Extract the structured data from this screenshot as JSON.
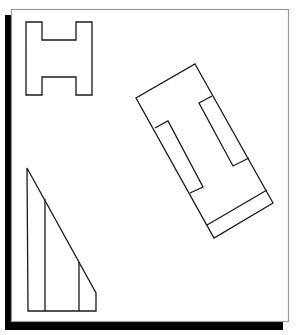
{
  "figure": {
    "panel": {
      "x": 11,
      "y": 9,
      "width": 278,
      "height": 313,
      "border_color": "#999999",
      "fill": "#ffffff"
    },
    "shadow": {
      "color": "#000000"
    },
    "stroke_color": "#1a1a1a",
    "shapes": [
      {
        "name": "h-shape",
        "points": "26,22 42,22 42,40 76,40 76,22 92,22 92,95 76,95 76,77 42,77 42,95 26,95"
      },
      {
        "name": "rotated-rectangle",
        "points": "195,64 273,203 214,238 136,98"
      },
      {
        "name": "rotated-notch-left",
        "points": "155,128 168,121 203,187 190,193"
      },
      {
        "name": "rotated-notch-right",
        "points": "212,96 199,103 233,166 249,158"
      },
      {
        "name": "rotated-bottom-strip",
        "points": "207,225 267,190"
      },
      {
        "name": "triangle",
        "points": "27,168 96,293 96,311 28,311"
      },
      {
        "name": "triangle-divider-1",
        "points": "45,199 45,311"
      },
      {
        "name": "triangle-divider-2",
        "points": "79,262 79,311"
      }
    ]
  }
}
